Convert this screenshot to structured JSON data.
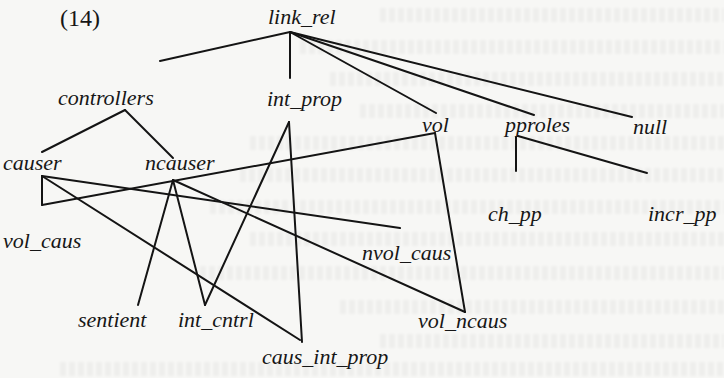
{
  "example_label": "(14)",
  "nodes": {
    "link_rel": "link_rel",
    "controllers": "controllers",
    "int_prop": "int_prop",
    "vol": "vol",
    "pproles": "pproles",
    "null": "null",
    "causer": "causer",
    "ncauser": "ncauser",
    "ch_pp": "ch_pp",
    "incr_pp": "incr_pp",
    "vol_caus": "vol_caus",
    "nvol_caus": "nvol_caus",
    "sentient": "sentient",
    "int_cntrl": "int_cntrl",
    "vol_ncaus": "vol_ncaus",
    "caus_int_prop": "caus_int_prop"
  },
  "edges": [
    {
      "from": "link_rel",
      "to": "controllers"
    },
    {
      "from": "link_rel",
      "to": "int_prop"
    },
    {
      "from": "link_rel",
      "to": "vol"
    },
    {
      "from": "link_rel",
      "to": "pproles"
    },
    {
      "from": "link_rel",
      "to": "null"
    },
    {
      "from": "controllers",
      "to": "causer"
    },
    {
      "from": "controllers",
      "to": "ncauser"
    },
    {
      "from": "int_prop",
      "to": "int_cntrl"
    },
    {
      "from": "int_prop",
      "to": "caus_int_prop"
    },
    {
      "from": "vol",
      "to": "vol_caus"
    },
    {
      "from": "vol",
      "to": "vol_ncaus"
    },
    {
      "from": "pproles",
      "to": "ch_pp"
    },
    {
      "from": "pproles",
      "to": "incr_pp"
    },
    {
      "from": "causer",
      "to": "vol_caus"
    },
    {
      "from": "causer",
      "to": "nvol_caus"
    },
    {
      "from": "causer",
      "to": "caus_int_prop"
    },
    {
      "from": "ncauser",
      "to": "sentient"
    },
    {
      "from": "ncauser",
      "to": "int_cntrl"
    },
    {
      "from": "ncauser",
      "to": "vol_ncaus"
    }
  ]
}
